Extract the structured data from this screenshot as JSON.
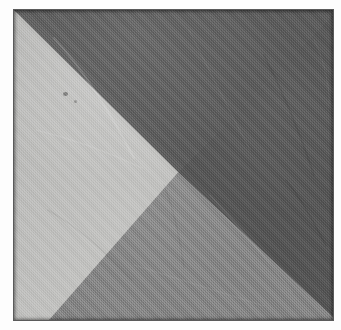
{
  "image": {
    "subject": "four-triangle fabric panel",
    "description": "Photograph of a square woven cloth divided into four triangular sections of differing gray tones meeting at an off-center point",
    "medium": "woven textile",
    "shape": "square panel",
    "background_color": "#fdfdfd",
    "width_px": 341,
    "height_px": 330
  },
  "panel": {
    "left_px": 14,
    "top_px": 10,
    "width_px": 319,
    "height_px": 310,
    "border_color": "#5a5a5a",
    "convergence_point": {
      "x_percent": 51.5,
      "y_percent": 52.3
    }
  },
  "quadrants": [
    {
      "name": "top",
      "label": "Top triangle",
      "color": "#5c5c5c",
      "tone": "dark gray"
    },
    {
      "name": "left",
      "label": "Left triangle",
      "color": "#c2c2c0",
      "tone": "light gray"
    },
    {
      "name": "right",
      "label": "Right triangle",
      "color": "#565656",
      "tone": "darkest gray"
    },
    {
      "name": "bottom",
      "label": "Bottom triangle",
      "color": "#858585",
      "tone": "medium gray"
    }
  ],
  "details": {
    "speck_label": "dark speck on light panel",
    "crease_label": "fabric crease",
    "weave_label": "woven weave texture",
    "edge_label": "panel edge shadow"
  }
}
